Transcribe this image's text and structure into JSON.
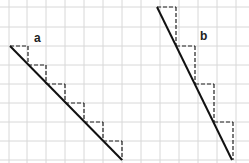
{
  "labels": {
    "a": "a",
    "b": "b"
  },
  "grid": {
    "color": "#d8d8d8",
    "x": [
      9,
      27,
      46,
      65,
      84,
      103,
      122,
      141,
      160,
      179,
      198,
      217,
      236
    ],
    "y": [
      7,
      27,
      46,
      65,
      84,
      103,
      122,
      141,
      160
    ]
  },
  "diagrams": [
    {
      "name": "a",
      "line": [
        10,
        46,
        122,
        160
      ],
      "steps": [
        [
          10,
          46,
          28,
          46,
          28,
          65
        ],
        [
          28,
          65,
          46,
          65,
          46,
          84
        ],
        [
          46,
          84,
          65,
          84,
          65,
          103
        ],
        [
          65,
          103,
          84,
          103,
          84,
          122
        ],
        [
          84,
          122,
          103,
          122,
          103,
          141
        ],
        [
          103,
          141,
          122,
          141,
          122,
          160
        ]
      ]
    },
    {
      "name": "b",
      "line": [
        157,
        7,
        232,
        160
      ],
      "steps": [
        [
          157,
          7,
          176,
          7,
          176,
          46
        ],
        [
          176,
          46,
          195,
          46,
          195,
          84
        ],
        [
          195,
          84,
          214,
          84,
          214,
          122
        ],
        [
          214,
          122,
          233,
          122,
          233,
          160
        ]
      ]
    }
  ]
}
